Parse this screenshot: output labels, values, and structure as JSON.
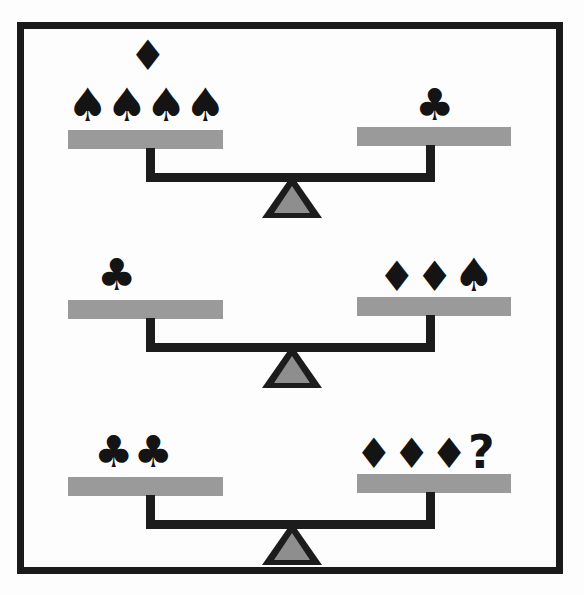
{
  "puzzle": {
    "type": "balance-scale-equation",
    "title": "Card suit balance puzzle",
    "symbols": {
      "spade": "♠",
      "club": "♣",
      "diamond": "♦",
      "question": "?"
    },
    "colors": {
      "frame": "#1a1a1a",
      "beam": "#1c1c1c",
      "pan": "#9a9a9a",
      "fulcrum_fill": "#8e8e8e",
      "fulcrum_outline": "#1c1c1c",
      "symbol": "#141414",
      "background": "#fdfdfd"
    },
    "scales": [
      {
        "index": 1,
        "name": "scale-one",
        "state": "balanced",
        "left": {
          "on_pan": [
            "♠",
            "♠",
            "♠",
            "♠"
          ],
          "on_pan_count": 4,
          "above": [
            "♦"
          ],
          "above_count": 1
        },
        "right": {
          "on_pan": [
            "♣"
          ],
          "on_pan_count": 1,
          "above": [],
          "above_count": 0
        }
      },
      {
        "index": 2,
        "name": "scale-two",
        "state": "balanced",
        "left": {
          "on_pan": [
            "♣"
          ],
          "on_pan_count": 1,
          "above": [],
          "above_count": 0
        },
        "right": {
          "on_pan": [
            "♦",
            "♦",
            "♠"
          ],
          "on_pan_count": 3,
          "above": [],
          "above_count": 0
        }
      },
      {
        "index": 3,
        "name": "scale-three",
        "state": "balanced",
        "left": {
          "on_pan": [
            "♣",
            "♣"
          ],
          "on_pan_count": 2,
          "above": [],
          "above_count": 0
        },
        "right": {
          "on_pan": [
            "♦",
            "♦",
            "♦",
            "?"
          ],
          "on_pan_count": 4,
          "above": [],
          "above_count": 0
        }
      }
    ]
  }
}
